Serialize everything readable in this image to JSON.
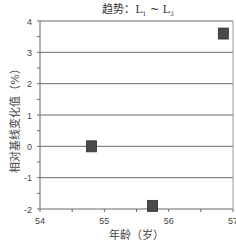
{
  "chart_data": {
    "type": "scatter",
    "title_parts": {
      "prefix": "趋势：L",
      "sub1": "1",
      "mid": " ~ L",
      "sub2": "3"
    },
    "xlabel": "年龄（岁）",
    "ylabel": "相对基线变化值（%）",
    "xlim": [
      54,
      57
    ],
    "ylim": [
      -2,
      4
    ],
    "xticks": [
      54,
      55,
      56,
      57
    ],
    "yticks": [
      -2,
      -1,
      0,
      1,
      2,
      3,
      4
    ],
    "grid": {
      "horizontal": true,
      "vertical": false
    },
    "legend": null,
    "series": [
      {
        "name": "L1~L3",
        "marker": "square",
        "color": "#4a4a4a",
        "points": [
          {
            "x": 54.8,
            "y": 0.0
          },
          {
            "x": 55.75,
            "y": -1.9
          },
          {
            "x": 56.85,
            "y": 3.6
          }
        ]
      }
    ]
  }
}
